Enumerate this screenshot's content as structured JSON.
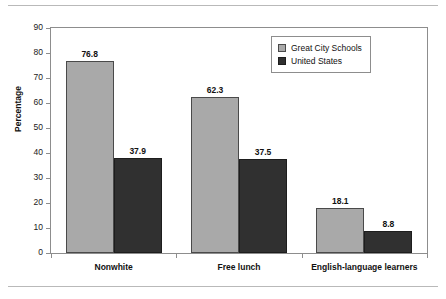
{
  "chart_data": {
    "type": "bar",
    "title": "",
    "xlabel": "",
    "ylabel": "Percentage",
    "ylim": [
      0,
      90
    ],
    "ytick_step": 10,
    "yticks": [
      0,
      10,
      20,
      30,
      40,
      50,
      60,
      70,
      80,
      90
    ],
    "grid": false,
    "legend_position": "top-right",
    "categories": [
      "Nonwhite",
      "Free lunch",
      "English-language learners"
    ],
    "series": [
      {
        "name": "Great City Schools",
        "color": "#a9a9a9",
        "values": [
          76.8,
          62.3,
          18.1
        ],
        "labels": [
          "76.8",
          "62.3",
          "18.1"
        ]
      },
      {
        "name": "United States",
        "color": "#303030",
        "values": [
          37.9,
          37.5,
          8.8
        ],
        "labels": [
          "37.9",
          "37.5",
          "8.8"
        ]
      }
    ]
  },
  "axis": {
    "y_title": "Percentage",
    "y_labels": [
      "90",
      "80",
      "70",
      "60",
      "50",
      "40",
      "30",
      "20",
      "10",
      "0"
    ]
  },
  "legend": {
    "entries": [
      {
        "label": "Great City Schools"
      },
      {
        "label": "United States"
      }
    ]
  }
}
